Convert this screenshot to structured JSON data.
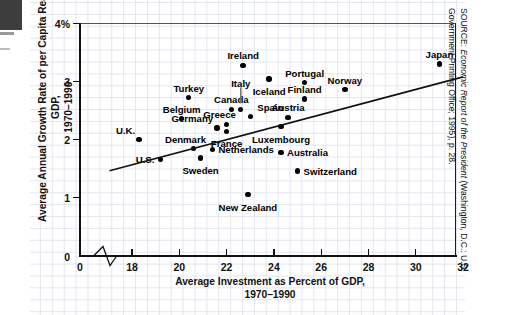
{
  "chart_data": {
    "type": "scatter",
    "title": "",
    "xlabel": "Average Investment as Percent of GDP, 1970–1990",
    "ylabel": "Average Annual Growth Rate of per Capita Real GDP, 1970–1990",
    "xlim": [
      17.0,
      32.0
    ],
    "ylim": [
      0,
      4
    ],
    "xticks": [
      "0",
      "18",
      "20",
      "22",
      "24",
      "26",
      "28",
      "30",
      "32"
    ],
    "yticks": [
      "0",
      "1",
      "2",
      "3",
      "4%"
    ],
    "grid": true,
    "axis_break": true,
    "legend": "none",
    "points": [
      {
        "label": "U.K.",
        "x": 18.3,
        "y": 2.0,
        "label_pos": "left-above"
      },
      {
        "label": "U.S.",
        "x": 19.2,
        "y": 1.66,
        "label_pos": "left"
      },
      {
        "label": "Belgium",
        "x": 20.1,
        "y": 2.36,
        "label_pos": "above"
      },
      {
        "label": "Turkey",
        "x": 20.4,
        "y": 2.72,
        "label_pos": "above"
      },
      {
        "label": "Denmark",
        "x": 20.6,
        "y": 1.84,
        "label_pos": "below-left"
      },
      {
        "label": "Sweden",
        "x": 20.9,
        "y": 1.68,
        "label_pos": "below"
      },
      {
        "label": "Germany",
        "x": 21.6,
        "y": 2.2,
        "label_pos": "left-above"
      },
      {
        "label": "Netherlands",
        "x": 21.4,
        "y": 1.83,
        "label_pos": "right"
      },
      {
        "label": "Canada",
        "x": 22.2,
        "y": 2.52,
        "label_pos": "above"
      },
      {
        "label": "Greece",
        "x": 22.0,
        "y": 2.26,
        "label_pos": "above-left"
      },
      {
        "label": "France",
        "x": 22.0,
        "y": 2.14,
        "label_pos": "below"
      },
      {
        "label": "Ireland",
        "x": 22.7,
        "y": 3.28,
        "label_pos": "above"
      },
      {
        "label": "Italy",
        "x": 22.6,
        "y": 2.52,
        "label_pos": "above-arrow"
      },
      {
        "label": "Spain",
        "x": 23.0,
        "y": 2.4,
        "label_pos": "right-above"
      },
      {
        "label": "New Zealand",
        "x": 22.9,
        "y": 1.05,
        "label_pos": "below"
      },
      {
        "label": "Iceland",
        "x": 23.8,
        "y": 3.04,
        "label_pos": "below"
      },
      {
        "label": "Australia",
        "x": 24.3,
        "y": 1.78,
        "label_pos": "right"
      },
      {
        "label": "Luxembourg",
        "x": 24.3,
        "y": 2.22,
        "label_pos": "below"
      },
      {
        "label": "Austria",
        "x": 24.6,
        "y": 2.38,
        "label_pos": "above"
      },
      {
        "label": "Switzerland",
        "x": 25.0,
        "y": 1.46,
        "label_pos": "right"
      },
      {
        "label": "Portugal",
        "x": 25.3,
        "y": 2.98,
        "label_pos": "above"
      },
      {
        "label": "Finland",
        "x": 25.3,
        "y": 2.7,
        "label_pos": "above"
      },
      {
        "label": "Norway",
        "x": 27.0,
        "y": 2.86,
        "label_pos": "above"
      },
      {
        "label": "Japan",
        "x": 31.0,
        "y": 3.3,
        "label_pos": "above"
      }
    ],
    "trendline": {
      "x0": 17.05,
      "y0": 1.46,
      "x1": 32.0,
      "y1": 3.08,
      "description": "fitted positive-slope regression line"
    }
  },
  "axes": {
    "y_title_line1": "Average Annual Growth Rate of per Capita Real GDP,",
    "y_title_line2": "1970–1990",
    "x_title_line1": "Average Investment as Percent of GDP,",
    "x_title_line2": "1970–1990",
    "y_ticks": [
      {
        "label": "4%",
        "value": 4
      },
      {
        "label": "3",
        "value": 3
      },
      {
        "label": "2",
        "value": 2
      },
      {
        "label": "1",
        "value": 1
      },
      {
        "label": "0",
        "value": 0
      }
    ],
    "x_ticks": [
      {
        "label": "0",
        "value": 0
      },
      {
        "label": "18",
        "value": 18
      },
      {
        "label": "20",
        "value": 20
      },
      {
        "label": "22",
        "value": 22
      },
      {
        "label": "24",
        "value": 24
      },
      {
        "label": "26",
        "value": 26
      },
      {
        "label": "28",
        "value": 28
      },
      {
        "label": "30",
        "value": 30
      },
      {
        "label": "32",
        "value": 32
      }
    ]
  },
  "source": {
    "prefix": "SOURCE: ",
    "italic_title": "Economic Report of the President",
    "rest": " (Washington, D.C.: U.S. Government Printing Office; 1995), p. 28."
  },
  "colors": {
    "ink": "#111111",
    "grid": "#e3e6ee",
    "dot": "#000000",
    "background": "#ffffff"
  }
}
